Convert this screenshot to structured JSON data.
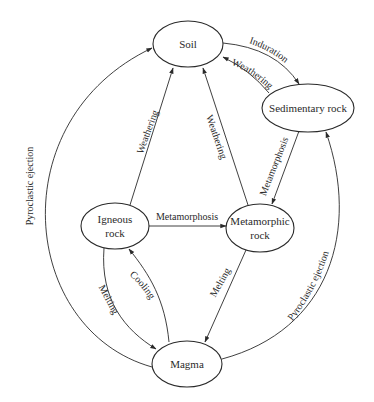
{
  "colors": {
    "stroke": "#2a2a2a",
    "background": "#ffffff"
  },
  "nodes": {
    "soil": {
      "label": "Soil"
    },
    "sedimentary": {
      "label": "Sedimentary rock"
    },
    "igneous": {
      "line1": "Igneous",
      "line2": "rock"
    },
    "metamorphic": {
      "line1": "Metamorphic",
      "line2": "rock"
    },
    "magma": {
      "label": "Magma"
    }
  },
  "edges": {
    "soil_to_sedimentary": {
      "label": "Induration",
      "from": "Soil",
      "to": "Sedimentary rock"
    },
    "sedimentary_to_soil": {
      "label": "Weathering",
      "from": "Sedimentary rock",
      "to": "Soil"
    },
    "igneous_to_soil": {
      "label": "Weathering",
      "from": "Igneous rock",
      "to": "Soil"
    },
    "metamorphic_to_soil": {
      "label": "Weathering",
      "from": "Metamorphic rock",
      "to": "Soil"
    },
    "sedimentary_to_metamorphic": {
      "label": "Metamorphosis",
      "from": "Sedimentary rock",
      "to": "Metamorphic rock"
    },
    "igneous_to_metamorphic": {
      "label": "Metamorphosis",
      "from": "Igneous rock",
      "to": "Metamorphic rock"
    },
    "igneous_to_magma": {
      "label": "Melting",
      "from": "Igneous rock",
      "to": "Magma"
    },
    "magma_to_igneous": {
      "label": "Cooling",
      "from": "Magma",
      "to": "Igneous rock"
    },
    "metamorphic_to_magma": {
      "label": "Melting",
      "from": "Metamorphic rock",
      "to": "Magma"
    },
    "magma_to_soil": {
      "label": "Pyroclastic ejection",
      "from": "Magma",
      "to": "Soil"
    },
    "magma_to_sedimentary": {
      "label": "Pyroclastic ejection",
      "from": "Magma",
      "to": "Sedimentary rock"
    }
  }
}
